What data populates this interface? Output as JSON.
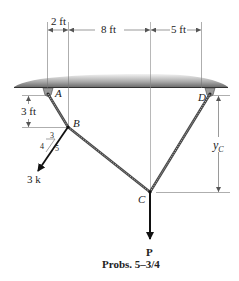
{
  "figure": {
    "caption": "Probs. 5–3/4",
    "load_label": "P",
    "force_label": "3 k",
    "colors": {
      "line": "#222222",
      "dim": "#555555",
      "ceiling_dark": "#7a7a7a",
      "ceiling_light": "#e6e6e6"
    }
  },
  "dimensions": {
    "horizontal": [
      "2 ft",
      "8 ft",
      "5 ft"
    ],
    "vertical_ab": "3 ft",
    "vertical_c": "y",
    "vertical_c_sub": "C"
  },
  "points": {
    "a": "A",
    "b": "B",
    "c": "C",
    "d": "D"
  },
  "slope": {
    "horizontal": "3",
    "vertical": "4",
    "hypotenuse": "5"
  }
}
